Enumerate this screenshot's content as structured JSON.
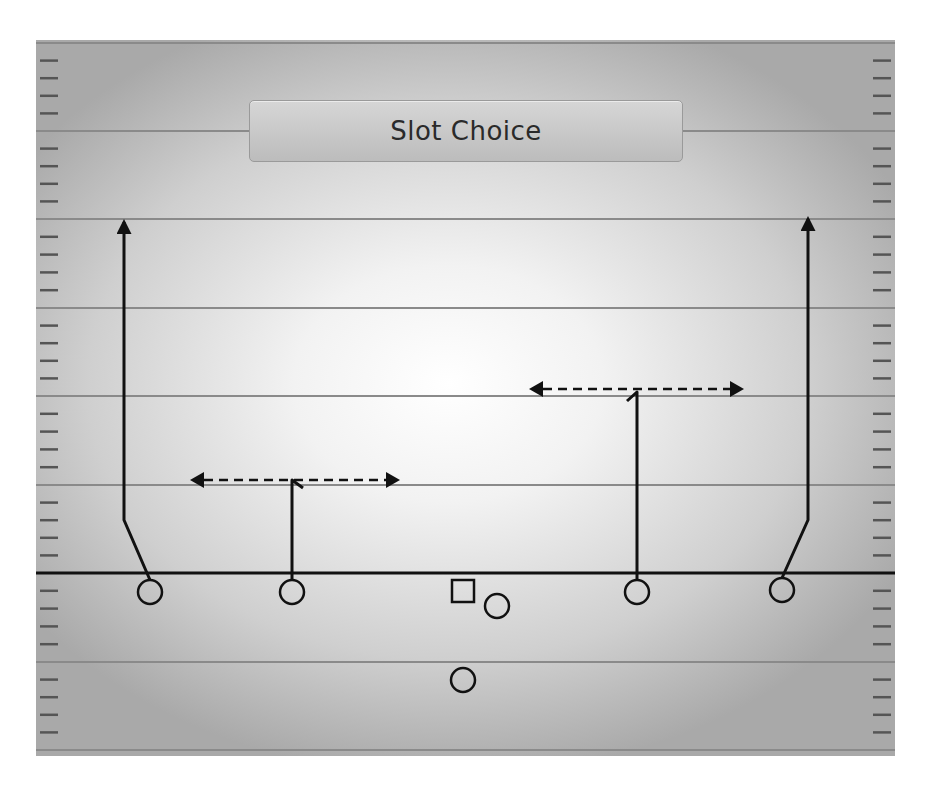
{
  "play": {
    "title": "Slot Choice"
  },
  "colors": {
    "ink": "#111111",
    "yard_line": "#8a8a8a",
    "hash": "#555555",
    "title_bg": "#c8c8c8",
    "title_text": "#2a2a2a"
  },
  "field": {
    "yard_lines_y": [
      43,
      131,
      219,
      308,
      396,
      485,
      662,
      750
    ],
    "line_of_scrimmage_y": 573
  },
  "players": [
    {
      "id": "wr-left",
      "shape": "circle",
      "x": 150,
      "y": 592
    },
    {
      "id": "slot-left",
      "shape": "circle",
      "x": 292,
      "y": 592
    },
    {
      "id": "center",
      "shape": "square",
      "x": 463,
      "y": 591
    },
    {
      "id": "qb-offset",
      "shape": "circle",
      "x": 497,
      "y": 606
    },
    {
      "id": "running-back",
      "shape": "circle",
      "x": 463,
      "y": 680
    },
    {
      "id": "slot-right",
      "shape": "circle",
      "x": 637,
      "y": 592
    },
    {
      "id": "wr-right",
      "shape": "circle",
      "x": 782,
      "y": 590
    }
  ],
  "routes": [
    {
      "id": "wr-left-go",
      "type": "solid-arrow",
      "points": [
        [
          150,
          580
        ],
        [
          124,
          520
        ],
        [
          124,
          222
        ]
      ]
    },
    {
      "id": "wr-right-go",
      "type": "solid-arrow",
      "points": [
        [
          782,
          578
        ],
        [
          808,
          520
        ],
        [
          808,
          219
        ]
      ]
    },
    {
      "id": "slot-left-stem",
      "type": "solid",
      "points": [
        [
          292,
          580
        ],
        [
          292,
          480
        ],
        [
          303,
          488
        ]
      ]
    },
    {
      "id": "slot-left-choice",
      "type": "dashed-double-arrow",
      "y": 480,
      "x1": 190,
      "x2": 400
    },
    {
      "id": "slot-right-stem",
      "type": "solid",
      "points": [
        [
          637,
          580
        ],
        [
          637,
          392
        ],
        [
          627,
          401
        ]
      ]
    },
    {
      "id": "slot-right-choice",
      "type": "dashed-double-arrow",
      "y": 389,
      "x1": 529,
      "x2": 744
    }
  ]
}
